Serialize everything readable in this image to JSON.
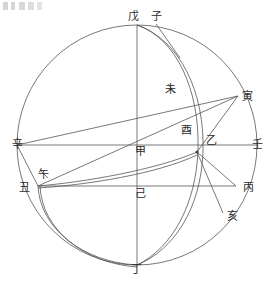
{
  "figure": {
    "title_visible": false,
    "type": "geometric-astronomical-diagram",
    "stroke_color": "#555555",
    "label_color": "#2b2b2b",
    "background": "#ffffff"
  },
  "geometry": {
    "main_circle": {
      "cx": 137,
      "cy": 145,
      "r": 120
    },
    "center_point": {
      "x": 137,
      "y": 145
    },
    "node_yi": {
      "x": 197,
      "y": 152
    }
  },
  "labels": [
    {
      "id": "wu-top",
      "text": "戊",
      "x": 133,
      "y": 17
    },
    {
      "id": "zi",
      "text": "子",
      "x": 156,
      "y": 17
    },
    {
      "id": "wei",
      "text": "未",
      "x": 170,
      "y": 90
    },
    {
      "id": "yin",
      "text": "寅",
      "x": 247,
      "y": 97
    },
    {
      "id": "you",
      "text": "酉",
      "x": 186,
      "y": 131
    },
    {
      "id": "yi",
      "text": "乙",
      "x": 211,
      "y": 141
    },
    {
      "id": "xin",
      "text": "辛",
      "x": 17,
      "y": 145
    },
    {
      "id": "ren",
      "text": "壬",
      "x": 257,
      "y": 145
    },
    {
      "id": "jia",
      "text": "甲",
      "x": 140,
      "y": 152
    },
    {
      "id": "wu-left",
      "text": "午",
      "x": 43,
      "y": 175
    },
    {
      "id": "chou",
      "text": "丑",
      "x": 24,
      "y": 188
    },
    {
      "id": "ji",
      "text": "己",
      "x": 140,
      "y": 194
    },
    {
      "id": "bing",
      "text": "丙",
      "x": 248,
      "y": 188
    },
    {
      "id": "hai",
      "text": "亥",
      "x": 232,
      "y": 217
    },
    {
      "id": "ding",
      "text": "丁",
      "x": 136,
      "y": 270
    }
  ],
  "caption": {
    "corner_mark_present": true
  }
}
